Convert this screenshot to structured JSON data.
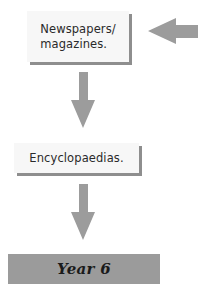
{
  "diagram": {
    "type": "flowchart",
    "nodes": [
      {
        "id": "newspapers",
        "label": "Newspapers/\nmagazines."
      },
      {
        "id": "encyclopaedias",
        "label": "Encyclopaedias."
      },
      {
        "id": "year6",
        "label": "Year 6"
      }
    ],
    "edges": [
      {
        "from": "external",
        "to": "newspapers",
        "direction": "left"
      },
      {
        "from": "newspapers",
        "to": "encyclopaedias",
        "direction": "down"
      },
      {
        "from": "encyclopaedias",
        "to": "year6",
        "direction": "down"
      }
    ],
    "colors": {
      "arrow": "#9c9c9c",
      "box_fill": "#f7f7f7",
      "box_shadow": "#8e8e8e",
      "year_box": "#9b9b9b",
      "text": "#2a2a2a"
    }
  }
}
